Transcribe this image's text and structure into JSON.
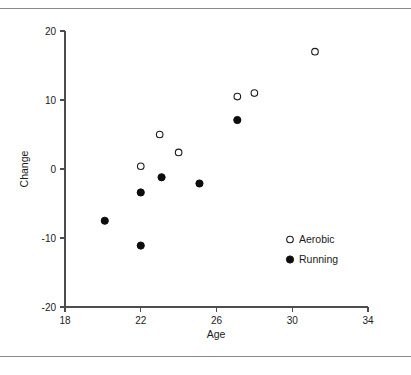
{
  "figure": {
    "background_color": "#ffffff",
    "rule_color": "#8a8a8a",
    "axis_color": "#4d4d4d",
    "text_color": "#1a1a1a"
  },
  "chart_data": {
    "type": "scatter",
    "title": "",
    "xlabel": "Age",
    "ylabel": "Change",
    "xlim": [
      18,
      34
    ],
    "ylim": [
      -20,
      20
    ],
    "xticks": [
      18,
      22,
      26,
      30,
      34
    ],
    "yticks": [
      20,
      10,
      0,
      -10,
      -20
    ],
    "xtick_labels": [
      "18",
      "22",
      "26",
      "30",
      "34"
    ],
    "ytick_labels": [
      "20",
      "10",
      "0",
      "-10",
      "-20"
    ],
    "grid": false,
    "legend_position": "lower right",
    "series": [
      {
        "name": "Aerobic",
        "marker": "open-circle",
        "color": "#1a1a1a",
        "points": [
          {
            "x": 22.0,
            "y": 0.4
          },
          {
            "x": 23.0,
            "y": 5.0
          },
          {
            "x": 24.0,
            "y": 2.4
          },
          {
            "x": 27.1,
            "y": 10.5
          },
          {
            "x": 28.0,
            "y": 11.0
          },
          {
            "x": 31.2,
            "y": 17.0
          }
        ]
      },
      {
        "name": "Running",
        "marker": "filled-circle",
        "color": "#0d0d0d",
        "points": [
          {
            "x": 20.1,
            "y": -7.5
          },
          {
            "x": 22.0,
            "y": -3.4
          },
          {
            "x": 22.0,
            "y": -11.1
          },
          {
            "x": 23.1,
            "y": -1.2
          },
          {
            "x": 25.1,
            "y": -2.1
          },
          {
            "x": 27.1,
            "y": 7.1
          }
        ]
      }
    ],
    "legend_entries": [
      {
        "label": "Aerobic",
        "marker": "open-circle"
      },
      {
        "label": "Running",
        "marker": "filled-circle"
      }
    ]
  }
}
